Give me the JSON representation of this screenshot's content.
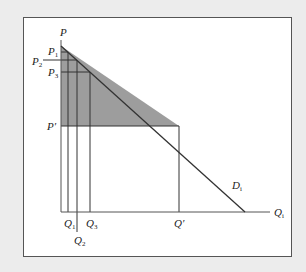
{
  "diagram": {
    "type": "economics-demand-curve",
    "axes": {
      "y_label": "P",
      "x_label": "Q",
      "x_label_sub": "i"
    },
    "curve": {
      "label": "D",
      "label_sub": "i"
    },
    "price_levels": [
      {
        "id": "P1",
        "label": "P",
        "sub": "1"
      },
      {
        "id": "P2",
        "label": "P",
        "sub": "2"
      },
      {
        "id": "P3",
        "label": "P",
        "sub": "3"
      },
      {
        "id": "Pprime",
        "label": "P′",
        "sub": ""
      }
    ],
    "quantity_levels": [
      {
        "id": "Q1",
        "label": "Q",
        "sub": "1"
      },
      {
        "id": "Q2",
        "label": "Q",
        "sub": "2"
      },
      {
        "id": "Q3",
        "label": "Q",
        "sub": "3"
      },
      {
        "id": "Qprime",
        "label": "Q′",
        "sub": ""
      }
    ],
    "colors": {
      "shaded_area": "#8c8c8c",
      "lines": "#333333",
      "background": "#ececec",
      "panel": "#ffffff"
    }
  }
}
